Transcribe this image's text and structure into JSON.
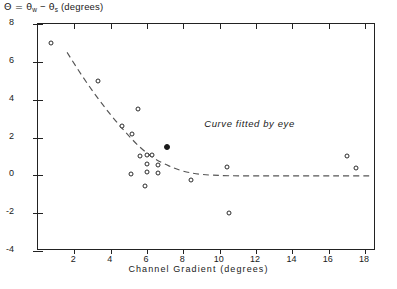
{
  "axes": {
    "ylabel_prefix": "Θ  =  ",
    "ylabel_theta1": "θ",
    "ylabel_sub1": "w",
    "ylabel_minus": " − ",
    "ylabel_theta2": "θ",
    "ylabel_sub2": "s",
    "ylabel_units": "  (degrees)",
    "xlabel": "Channel   Gradient   (degrees)"
  },
  "annotation": {
    "text": "Curve  fitted  by  eye"
  },
  "chart_data": {
    "type": "scatter",
    "title": "",
    "xlabel": "Channel Gradient (degrees)",
    "ylabel": "Θ = θw − θs (degrees)",
    "xlim": [
      0,
      18.6
    ],
    "ylim": [
      -4,
      8
    ],
    "xticks": [
      2,
      4,
      6,
      8,
      10,
      12,
      14,
      16,
      18
    ],
    "xtick_labels": [
      "2",
      "4",
      "6",
      "8",
      "10",
      "12",
      "14",
      "16",
      "18"
    ],
    "yticks": [
      -4,
      -2,
      0,
      2,
      4,
      6,
      8
    ],
    "ytick_labels": [
      "-4",
      "-2",
      "0",
      "2",
      "4",
      "6",
      "8"
    ],
    "grid": false,
    "legend": null,
    "series": [
      {
        "name": "observations",
        "marker": "open-circle",
        "points": [
          [
            0.7,
            7.0
          ],
          [
            3.3,
            5.0
          ],
          [
            4.6,
            2.6
          ],
          [
            5.5,
            3.5
          ],
          [
            5.2,
            2.2
          ],
          [
            5.1,
            0.05
          ],
          [
            6.0,
            1.1
          ],
          [
            6.0,
            0.6
          ],
          [
            6.0,
            0.15
          ],
          [
            5.6,
            1.0
          ],
          [
            6.3,
            1.05
          ],
          [
            6.6,
            0.55
          ],
          [
            6.6,
            0.1
          ],
          [
            5.9,
            -0.55
          ],
          [
            8.4,
            -0.25
          ],
          [
            10.4,
            0.45
          ],
          [
            10.5,
            -2.0
          ],
          [
            17.0,
            1.0
          ],
          [
            17.5,
            0.4
          ]
        ]
      },
      {
        "name": "highlighted-observation",
        "marker": "filled-circle",
        "points": [
          [
            7.1,
            1.5
          ]
        ]
      }
    ],
    "fit_curve": {
      "name": "Curve fitted by eye",
      "style": "dashed",
      "points": [
        [
          1.6,
          6.5
        ],
        [
          2.4,
          5.3
        ],
        [
          3.2,
          4.2
        ],
        [
          4.0,
          3.2
        ],
        [
          4.8,
          2.3
        ],
        [
          5.6,
          1.5
        ],
        [
          6.4,
          0.9
        ],
        [
          7.2,
          0.5
        ],
        [
          8.0,
          0.22
        ],
        [
          9.0,
          0.05
        ],
        [
          10.5,
          -0.02
        ],
        [
          12.5,
          -0.03
        ],
        [
          14.5,
          -0.03
        ],
        [
          16.5,
          -0.03
        ],
        [
          18.4,
          -0.03
        ]
      ]
    }
  }
}
